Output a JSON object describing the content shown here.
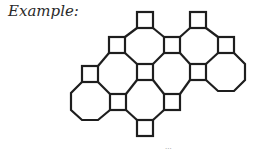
{
  "caption": "Example:",
  "diagram": {
    "type": "truncated-square tiling fragment (octagons and squares)",
    "stroke_color": "#1e1e1e",
    "background": "#ffffff",
    "square_size": 16,
    "square_centers": [
      [
        145,
        20
      ],
      [
        198,
        20
      ],
      [
        117,
        45
      ],
      [
        172,
        45
      ],
      [
        226,
        45
      ],
      [
        90,
        72
      ],
      [
        145,
        72
      ],
      [
        198,
        72
      ],
      [
        118,
        102
      ],
      [
        172,
        102
      ],
      [
        145,
        128
      ]
    ],
    "octagon_centers": [
      [
        145,
        46
      ],
      [
        198,
        46
      ],
      [
        117,
        72
      ],
      [
        172,
        72
      ],
      [
        226,
        72
      ],
      [
        90,
        101
      ],
      [
        145,
        101
      ]
    ]
  },
  "footer_fragment": "..."
}
